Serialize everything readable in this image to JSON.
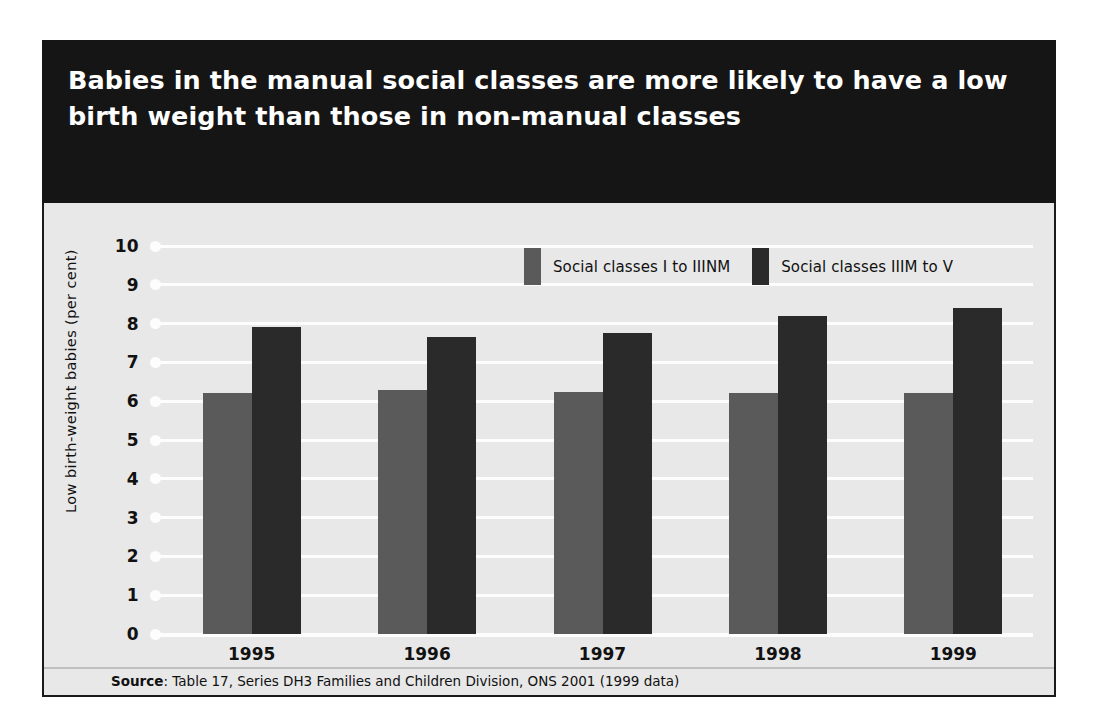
{
  "title": "Babies in the manual social classes are more likely to have a low birth weight than those in non-manual classes",
  "source": {
    "prefix": "Source",
    "text": ": Table 17, Series DH3 Families and Children Division, ONS 2001 (1999 data)"
  },
  "colors": {
    "title_band": "#151515",
    "panel_background": "#e8e8e8",
    "panel_border": "#1a1a1a",
    "gridline": "#fdfdfd",
    "series_a": "#5a5a5a",
    "series_b": "#2a2a2a",
    "text": "#111111"
  },
  "chart_data": {
    "type": "bar",
    "title": "Babies in the manual social classes are more likely to have a low birth weight than those in non-manual classes",
    "xlabel": "",
    "ylabel": "Low birth-weight babies (per cent)",
    "ylim": [
      0,
      10
    ],
    "yticks": [
      10,
      9,
      8,
      7,
      6,
      5,
      4,
      3,
      2,
      1,
      0
    ],
    "grid": true,
    "legend_position": "top-right",
    "categories": [
      "1995",
      "1996",
      "1997",
      "1998",
      "1999"
    ],
    "series": [
      {
        "name": "Social classes I to IIINM",
        "color": "#5a5a5a",
        "values": [
          6.2,
          6.3,
          6.25,
          6.2,
          6.2
        ]
      },
      {
        "name": "Social classes IIIM to V",
        "color": "#2a2a2a",
        "values": [
          7.9,
          7.65,
          7.75,
          8.2,
          8.4
        ]
      }
    ]
  }
}
